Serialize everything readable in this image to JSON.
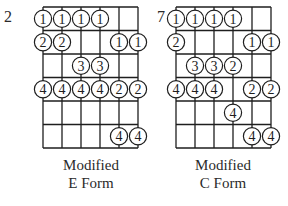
{
  "diagrams": [
    {
      "id": "e-form",
      "title_line1": "Modified",
      "title_line2": "E Form",
      "start_fret": "2",
      "origin_x": 43,
      "notes": [
        {
          "string": 0,
          "row": 0,
          "finger": "1"
        },
        {
          "string": 1,
          "row": 0,
          "finger": "1"
        },
        {
          "string": 2,
          "row": 0,
          "finger": "1"
        },
        {
          "string": 3,
          "row": 0,
          "finger": "1"
        },
        {
          "string": 0,
          "row": 1,
          "finger": "2"
        },
        {
          "string": 1,
          "row": 1,
          "finger": "2"
        },
        {
          "string": 4,
          "row": 1,
          "finger": "1"
        },
        {
          "string": 5,
          "row": 1,
          "finger": "1"
        },
        {
          "string": 2,
          "row": 2,
          "finger": "3"
        },
        {
          "string": 3,
          "row": 2,
          "finger": "3"
        },
        {
          "string": 0,
          "row": 3,
          "finger": "4"
        },
        {
          "string": 1,
          "row": 3,
          "finger": "4"
        },
        {
          "string": 2,
          "row": 3,
          "finger": "4"
        },
        {
          "string": 3,
          "row": 3,
          "finger": "4"
        },
        {
          "string": 4,
          "row": 3,
          "finger": "2"
        },
        {
          "string": 5,
          "row": 3,
          "finger": "2"
        },
        {
          "string": 4,
          "row": 5,
          "finger": "4"
        },
        {
          "string": 5,
          "row": 5,
          "finger": "4"
        }
      ]
    },
    {
      "id": "c-form",
      "title_line1": "Modified",
      "title_line2": "C Form",
      "start_fret": "7",
      "origin_x": 176,
      "notes": [
        {
          "string": 0,
          "row": 0,
          "finger": "1"
        },
        {
          "string": 1,
          "row": 0,
          "finger": "1"
        },
        {
          "string": 2,
          "row": 0,
          "finger": "1"
        },
        {
          "string": 3,
          "row": 0,
          "finger": "1"
        },
        {
          "string": 0,
          "row": 1,
          "finger": "2"
        },
        {
          "string": 4,
          "row": 1,
          "finger": "1"
        },
        {
          "string": 5,
          "row": 1,
          "finger": "1"
        },
        {
          "string": 1,
          "row": 2,
          "finger": "3"
        },
        {
          "string": 2,
          "row": 2,
          "finger": "3"
        },
        {
          "string": 3,
          "row": 2,
          "finger": "2"
        },
        {
          "string": 0,
          "row": 3,
          "finger": "4"
        },
        {
          "string": 1,
          "row": 3,
          "finger": "4"
        },
        {
          "string": 2,
          "row": 3,
          "finger": "4"
        },
        {
          "string": 4,
          "row": 3,
          "finger": "2"
        },
        {
          "string": 5,
          "row": 3,
          "finger": "2"
        },
        {
          "string": 3,
          "row": 4,
          "finger": "4"
        },
        {
          "string": 4,
          "row": 5,
          "finger": "4"
        },
        {
          "string": 5,
          "row": 5,
          "finger": "4"
        }
      ]
    }
  ],
  "grid": {
    "strings": 6,
    "frets": 6,
    "string_spacing": 19,
    "fret_spacing": 23.5,
    "top_y": 7,
    "dot_radius": 8.6,
    "line_color": "#1e1e1e"
  }
}
